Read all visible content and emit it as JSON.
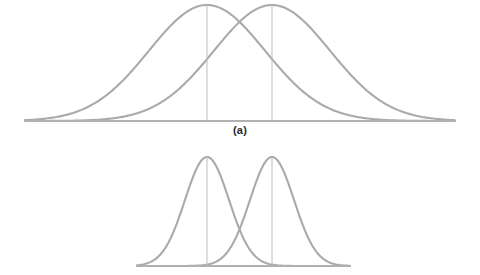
{
  "figure": {
    "title": "",
    "background_color": "#ffffff",
    "curve_color": "#aaaaaa",
    "axis_color": "#b0b0b0",
    "marker_line_color": "#bdbdbd",
    "caption_color": "#2b2b2b",
    "width": 480,
    "height": 275
  },
  "panels": [
    {
      "id": "panel-a",
      "caption": "(a)",
      "description": "Two overlapping normal distributions with large variance",
      "baseline": {
        "x_start": 25,
        "x_end": 455,
        "y": 121
      },
      "peak_y": 5,
      "curves": [
        {
          "name": "curve-a-left",
          "mean_x": 207,
          "std_px": 58,
          "peak_y": 5
        },
        {
          "name": "curve-a-right",
          "mean_x": 272,
          "std_px": 58,
          "peak_y": 5
        }
      ],
      "mean_lines": [
        {
          "name": "mean-line-a-left",
          "x": 207
        },
        {
          "name": "mean-line-a-right",
          "x": 272
        }
      ]
    },
    {
      "id": "panel-b",
      "caption": "",
      "description": "Two overlapping normal distributions with small variance",
      "baseline": {
        "x_start": 137,
        "x_end": 350,
        "y": 266
      },
      "peak_y": 157,
      "curves": [
        {
          "name": "curve-b-left",
          "mean_x": 207,
          "std_px": 22,
          "peak_y": 157
        },
        {
          "name": "curve-b-right",
          "mean_x": 272,
          "std_px": 22,
          "peak_y": 157
        }
      ],
      "mean_lines": [
        {
          "name": "mean-line-b-left",
          "x": 207
        },
        {
          "name": "mean-line-b-right",
          "x": 272
        }
      ]
    }
  ],
  "chart_data": {
    "type": "line",
    "title": "",
    "subtitle": "",
    "xlabel": "",
    "ylabel": "",
    "grid": false,
    "legend": null,
    "annotations": [
      {
        "text": "(a)",
        "x": 240,
        "y": 130,
        "role": "panel-caption"
      }
    ],
    "panels": [
      {
        "panel": "(a)",
        "type": "line",
        "description": "Two normal (Gaussian) density curves with identical large standard deviation and different means; vertical lines mark each mean. Curves overlap substantially.",
        "xlim": [
          25,
          455
        ],
        "ylim": [
          0,
          1
        ],
        "series": [
          {
            "name": "Distribution 1 (large variance)",
            "distribution": "normal",
            "mean": 207,
            "sigma": 58,
            "peak_height": 1.0,
            "x": [
              25,
              60,
              91,
              120,
              149,
              178,
              207,
              236,
              265,
              294,
              323,
              352,
              389,
              455
            ],
            "values": [
              0.0,
              0.01,
              0.04,
              0.12,
              0.27,
              0.49,
              1.0,
              0.49,
              0.27,
              0.12,
              0.04,
              0.01,
              0.0,
              0.0
            ]
          },
          {
            "name": "Distribution 2 (large variance)",
            "distribution": "normal",
            "mean": 272,
            "sigma": 58,
            "peak_height": 1.0,
            "x": [
              25,
              91,
              128,
              156,
              185,
              214,
              243,
              272,
              301,
              330,
              359,
              388,
              417,
              455
            ],
            "values": [
              0.0,
              0.0,
              0.01,
              0.04,
              0.12,
              0.27,
              0.49,
              1.0,
              0.49,
              0.27,
              0.12,
              0.04,
              0.01,
              0.0
            ]
          }
        ],
        "vertical_markers": [
          207,
          272
        ]
      },
      {
        "panel": "(b)",
        "type": "line",
        "description": "Two normal (Gaussian) density curves with identical small standard deviation and the same means as panel (a); vertical lines mark each mean. Curves overlap only slightly.",
        "xlim": [
          137,
          350
        ],
        "ylim": [
          0,
          1
        ],
        "series": [
          {
            "name": "Distribution 1 (small variance)",
            "distribution": "normal",
            "mean": 207,
            "sigma": 22,
            "peak_height": 1.0,
            "x": [
              137,
              152,
              163,
              174,
              185,
              196,
              207,
              218,
              229,
              240,
              251,
              262,
              273,
              290
            ],
            "values": [
              0.0,
              0.02,
              0.05,
              0.12,
              0.27,
              0.6,
              1.0,
              0.6,
              0.27,
              0.12,
              0.05,
              0.02,
              0.0,
              0.0
            ]
          },
          {
            "name": "Distribution 2 (small variance)",
            "distribution": "normal",
            "mean": 272,
            "sigma": 22,
            "peak_height": 1.0,
            "x": [
              195,
              206,
              217,
              228,
              239,
              250,
              261,
              272,
              283,
              294,
              305,
              316,
              327,
              350
            ],
            "values": [
              0.0,
              0.0,
              0.02,
              0.05,
              0.12,
              0.27,
              0.6,
              1.0,
              0.6,
              0.27,
              0.12,
              0.05,
              0.02,
              0.0
            ]
          }
        ],
        "vertical_markers": [
          207,
          272
        ]
      }
    ]
  }
}
